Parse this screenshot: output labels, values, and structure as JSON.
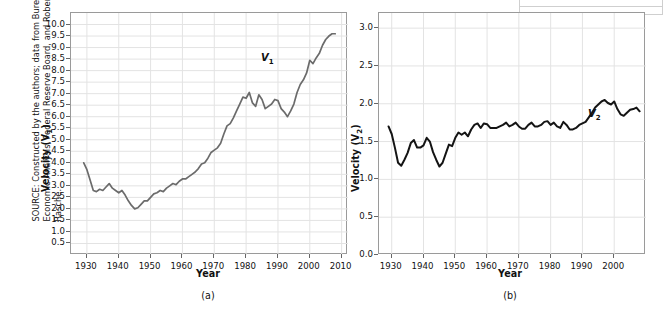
{
  "source_note": "SOURCE: Constructed by the authors; data from Bureau of Economic Analysis, Federal Reserve Board, and Robert Rasche.",
  "panel_a": {
    "caption": "(a)",
    "series_label": "V",
    "series_sub": "1",
    "xlabel": "Year",
    "ylabel": "Velocity (V",
    "ylabel_sub": "1",
    "ylabel_end": ")"
  },
  "panel_b": {
    "caption": "(b)",
    "series_label": "V",
    "series_sub": "2",
    "xlabel": "Year",
    "ylabel": "Velocity (V",
    "ylabel_sub": "2",
    "ylabel_end": ")"
  },
  "chart_data": [
    {
      "type": "line",
      "title": "(a)",
      "xlabel": "Year",
      "ylabel": "Velocity (V1)",
      "xlim": [
        1925,
        2012
      ],
      "ylim": [
        0.0,
        10.5
      ],
      "xticks": [
        1930,
        1940,
        1950,
        1960,
        1970,
        1980,
        1990,
        2000,
        2010
      ],
      "yticks": [
        0.5,
        1.0,
        1.5,
        2.0,
        2.5,
        3.0,
        3.5,
        4.0,
        4.5,
        5.0,
        5.5,
        6.0,
        6.5,
        7.0,
        7.5,
        8.0,
        8.5,
        9.0,
        9.5,
        10.0
      ],
      "grid": true,
      "legend": "none",
      "series": [
        {
          "name": "V1",
          "color": "#6b6b6b",
          "x": [
            1929,
            1930,
            1931,
            1932,
            1933,
            1934,
            1935,
            1936,
            1937,
            1938,
            1939,
            1940,
            1941,
            1942,
            1943,
            1944,
            1945,
            1946,
            1947,
            1948,
            1949,
            1950,
            1951,
            1952,
            1953,
            1954,
            1955,
            1956,
            1957,
            1958,
            1959,
            1960,
            1961,
            1962,
            1963,
            1964,
            1965,
            1966,
            1967,
            1968,
            1969,
            1970,
            1971,
            1972,
            1973,
            1974,
            1975,
            1976,
            1977,
            1978,
            1979,
            1980,
            1981,
            1982,
            1983,
            1984,
            1985,
            1986,
            1987,
            1988,
            1989,
            1990,
            1991,
            1992,
            1993,
            1994,
            1995,
            1996,
            1997,
            1998,
            1999,
            2000,
            2001,
            2002,
            2003,
            2004,
            2005,
            2006,
            2007,
            2008
          ],
          "y": [
            4.0,
            3.7,
            3.25,
            2.8,
            2.75,
            2.85,
            2.8,
            2.95,
            3.1,
            2.9,
            2.8,
            2.7,
            2.8,
            2.6,
            2.35,
            2.15,
            2.0,
            2.05,
            2.2,
            2.35,
            2.35,
            2.5,
            2.65,
            2.7,
            2.8,
            2.75,
            2.9,
            3.0,
            3.1,
            3.05,
            3.2,
            3.3,
            3.3,
            3.4,
            3.5,
            3.6,
            3.75,
            3.95,
            4.0,
            4.2,
            4.45,
            4.55,
            4.65,
            4.85,
            5.25,
            5.6,
            5.7,
            5.95,
            6.25,
            6.55,
            6.85,
            6.8,
            7.05,
            6.6,
            6.45,
            6.95,
            6.75,
            6.35,
            6.45,
            6.55,
            6.75,
            6.7,
            6.35,
            6.2,
            6.0,
            6.25,
            6.55,
            7.05,
            7.4,
            7.6,
            7.9,
            8.45,
            8.3,
            8.55,
            8.75,
            9.1,
            9.35,
            9.5,
            9.6,
            9.6
          ]
        }
      ]
    },
    {
      "type": "line",
      "title": "(b)",
      "xlabel": "Year",
      "ylabel": "Velocity (V2)",
      "xlim": [
        1926,
        2010
      ],
      "ylim": [
        0.0,
        3.2
      ],
      "xticks": [
        1930,
        1940,
        1950,
        1960,
        1970,
        1980,
        1990,
        2000
      ],
      "yticks": [
        0.0,
        0.5,
        1.0,
        1.5,
        2.0,
        2.5,
        3.0
      ],
      "grid": true,
      "legend": "none",
      "series": [
        {
          "name": "V2",
          "color": "#141414",
          "x": [
            1929,
            1930,
            1931,
            1932,
            1933,
            1934,
            1935,
            1936,
            1937,
            1938,
            1939,
            1940,
            1941,
            1942,
            1943,
            1944,
            1945,
            1946,
            1947,
            1948,
            1949,
            1950,
            1951,
            1952,
            1953,
            1954,
            1955,
            1956,
            1957,
            1958,
            1959,
            1960,
            1961,
            1962,
            1963,
            1964,
            1965,
            1966,
            1967,
            1968,
            1969,
            1970,
            1971,
            1972,
            1973,
            1974,
            1975,
            1976,
            1977,
            1978,
            1979,
            1980,
            1981,
            1982,
            1983,
            1984,
            1985,
            1986,
            1987,
            1988,
            1989,
            1990,
            1991,
            1992,
            1993,
            1994,
            1995,
            1996,
            1997,
            1998,
            1999,
            2000,
            2001,
            2002,
            2003,
            2004,
            2005,
            2006,
            2007,
            2008
          ],
          "y": [
            1.7,
            1.6,
            1.42,
            1.22,
            1.18,
            1.26,
            1.35,
            1.48,
            1.52,
            1.42,
            1.42,
            1.45,
            1.55,
            1.5,
            1.36,
            1.26,
            1.17,
            1.22,
            1.34,
            1.46,
            1.44,
            1.55,
            1.62,
            1.59,
            1.62,
            1.57,
            1.66,
            1.72,
            1.74,
            1.68,
            1.74,
            1.73,
            1.68,
            1.68,
            1.68,
            1.7,
            1.72,
            1.75,
            1.7,
            1.72,
            1.75,
            1.7,
            1.67,
            1.67,
            1.72,
            1.75,
            1.7,
            1.7,
            1.72,
            1.76,
            1.77,
            1.72,
            1.75,
            1.7,
            1.68,
            1.76,
            1.72,
            1.66,
            1.66,
            1.68,
            1.72,
            1.74,
            1.76,
            1.82,
            1.88,
            1.95,
            1.99,
            2.03,
            2.05,
            2.01,
            1.99,
            2.03,
            1.93,
            1.86,
            1.84,
            1.88,
            1.92,
            1.93,
            1.95,
            1.9
          ]
        }
      ]
    }
  ]
}
